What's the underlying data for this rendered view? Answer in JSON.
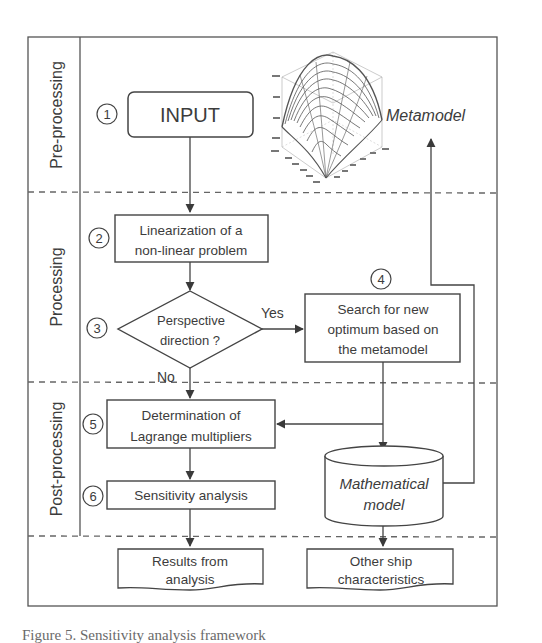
{
  "diagram": {
    "phases": [
      {
        "id": "pre",
        "label": "Pre-processing"
      },
      {
        "id": "proc",
        "label": "Processing"
      },
      {
        "id": "post",
        "label": "Post-processing"
      }
    ],
    "nodes": {
      "input": {
        "step": "①",
        "label": "INPUT"
      },
      "linearization": {
        "step": "②",
        "line1": "Linearization of a",
        "line2": "non-linear problem"
      },
      "decision": {
        "step": "③",
        "line1": "Perspective",
        "line2": "direction ?",
        "yes_label": "Yes",
        "no_label": "No"
      },
      "search": {
        "step": "④",
        "line1": "Search for new",
        "line2": "optimum based on",
        "line3": "the metamodel"
      },
      "lagrange": {
        "step": "⑤",
        "line1": "Determination of",
        "line2": "Lagrange multipliers"
      },
      "sensitivity": {
        "step": "⑥",
        "label": "Sensitivity analysis"
      },
      "math_model": {
        "line1": "Mathematical",
        "line2": "model"
      },
      "metamodel": {
        "label": "Metamodel"
      },
      "results": {
        "line1": "Results from",
        "line2": "analysis"
      },
      "ship": {
        "line1": "Other ship",
        "line2": "characteristics"
      }
    },
    "edges": [
      {
        "from": "input",
        "to": "linearization"
      },
      {
        "from": "linearization",
        "to": "decision"
      },
      {
        "from": "decision",
        "to": "search",
        "label": "Yes"
      },
      {
        "from": "decision",
        "to": "lagrange",
        "label": "No"
      },
      {
        "from": "search",
        "to": "math_model"
      },
      {
        "from": "search",
        "to": "lagrange"
      },
      {
        "from": "lagrange",
        "to": "sensitivity"
      },
      {
        "from": "sensitivity",
        "to": "results"
      },
      {
        "from": "math_model",
        "to": "ship"
      },
      {
        "from": "math_model",
        "to": "metamodel"
      }
    ],
    "colors": {
      "line": "#4a4a4a",
      "dashed": "#6a6a6a",
      "background": "#ffffff"
    }
  },
  "caption": "Figure 5.   Sensitivity analysis framework"
}
